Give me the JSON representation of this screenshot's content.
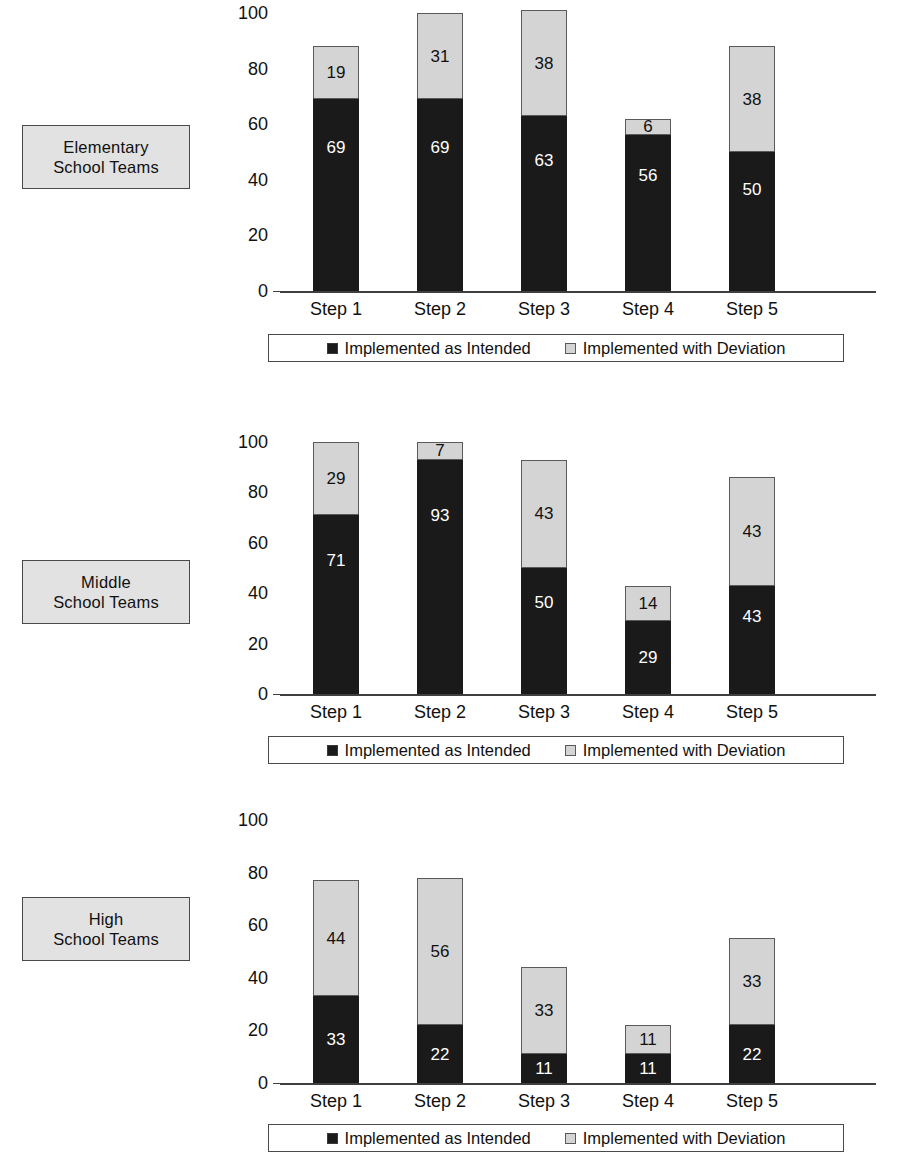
{
  "legend": {
    "series_dark_label": "Implemented as Intended",
    "series_light_label": "Implemented with Deviation",
    "dark_swatch_icon": "filled-square-icon",
    "light_swatch_icon": "outlined-square-icon",
    "dark_color": "#1a1a1a",
    "light_color": "#d4d4d4"
  },
  "yticks": [
    "100",
    "80",
    "60",
    "40",
    "20",
    "0"
  ],
  "panels": [
    {
      "label_line1": "Elementary",
      "label_line2": "School Teams",
      "ticks": [
        "100",
        "80",
        "60",
        "40",
        "20",
        "0"
      ],
      "xticks": [
        "Step 1",
        "Step 2",
        "Step 3",
        "Step 4",
        "Step 5"
      ],
      "dark": [
        "69",
        "69",
        "63",
        "56",
        "50"
      ],
      "light": [
        "19",
        "31",
        "38",
        "6",
        "38"
      ]
    },
    {
      "label_line1": "Middle",
      "label_line2": "School Teams",
      "ticks": [
        "100",
        "80",
        "60",
        "40",
        "20",
        "0"
      ],
      "xticks": [
        "Step 1",
        "Step 2",
        "Step 3",
        "Step 4",
        "Step 5"
      ],
      "dark": [
        "71",
        "93",
        "50",
        "29",
        "43"
      ],
      "light": [
        "29",
        "7",
        "43",
        "14",
        "43"
      ]
    },
    {
      "label_line1": "High",
      "label_line2": "School Teams",
      "ticks": [
        "100",
        "80",
        "60",
        "40",
        "20",
        "0"
      ],
      "xticks": [
        "Step 1",
        "Step 2",
        "Step 3",
        "Step 4",
        "Step 5"
      ],
      "dark": [
        "33",
        "22",
        "11",
        "11",
        "22"
      ],
      "light": [
        "44",
        "56",
        "33",
        "11",
        "33"
      ]
    }
  ],
  "chart_data": [
    {
      "type": "bar",
      "title": "Elementary School Teams",
      "stacked": true,
      "categories": [
        "Step 1",
        "Step 2",
        "Step 3",
        "Step 4",
        "Step 5"
      ],
      "series": [
        {
          "name": "Implemented as Intended",
          "values": [
            69,
            69,
            63,
            56,
            50
          ],
          "color": "#1a1a1a"
        },
        {
          "name": "Implemented with Deviation",
          "values": [
            19,
            31,
            38,
            6,
            38
          ],
          "color": "#d4d4d4"
        }
      ],
      "totals": [
        88,
        100,
        101,
        62,
        88
      ],
      "xlabel": "",
      "ylabel": "",
      "ylim": [
        0,
        100
      ],
      "yticks": [
        0,
        20,
        40,
        60,
        80,
        100
      ],
      "grid": false,
      "legend_position": "bottom"
    },
    {
      "type": "bar",
      "title": "Middle School Teams",
      "stacked": true,
      "categories": [
        "Step 1",
        "Step 2",
        "Step 3",
        "Step 4",
        "Step 5"
      ],
      "series": [
        {
          "name": "Implemented as Intended",
          "values": [
            71,
            93,
            50,
            29,
            43
          ],
          "color": "#1a1a1a"
        },
        {
          "name": "Implemented with Deviation",
          "values": [
            29,
            7,
            43,
            14,
            43
          ],
          "color": "#d4d4d4"
        }
      ],
      "totals": [
        100,
        100,
        93,
        43,
        86
      ],
      "xlabel": "",
      "ylabel": "",
      "ylim": [
        0,
        100
      ],
      "yticks": [
        0,
        20,
        40,
        60,
        80,
        100
      ],
      "grid": false,
      "legend_position": "bottom"
    },
    {
      "type": "bar",
      "title": "High School Teams",
      "stacked": true,
      "categories": [
        "Step 1",
        "Step 2",
        "Step 3",
        "Step 4",
        "Step 5"
      ],
      "series": [
        {
          "name": "Implemented as Intended",
          "values": [
            33,
            22,
            11,
            11,
            22
          ],
          "color": "#1a1a1a"
        },
        {
          "name": "Implemented with Deviation",
          "values": [
            44,
            56,
            33,
            11,
            33
          ],
          "color": "#d4d4d4"
        }
      ],
      "totals": [
        77,
        78,
        44,
        22,
        55
      ],
      "xlabel": "",
      "ylabel": "",
      "ylim": [
        0,
        100
      ],
      "yticks": [
        0,
        20,
        40,
        60,
        80,
        100
      ],
      "grid": false,
      "legend_position": "bottom"
    }
  ]
}
